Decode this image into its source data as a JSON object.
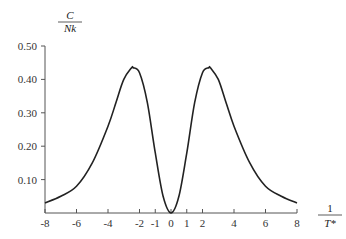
{
  "chart_data": {
    "type": "line",
    "title": "",
    "ylabel": {
      "numerator": "C",
      "denominator": "Nk"
    },
    "xlabel": {
      "numerator": "1",
      "denominator": "T*"
    },
    "xlim": [
      -8,
      8
    ],
    "ylim": [
      0,
      0.5
    ],
    "x_ticks": [
      -8,
      -6,
      -4,
      -2,
      -1,
      0,
      1,
      2,
      4,
      6,
      8
    ],
    "x_tick_labels": [
      "-8",
      "-6",
      "-4",
      "-2",
      "-1",
      "0",
      "1",
      "2",
      "4",
      "6",
      "8"
    ],
    "y_ticks": [
      0.1,
      0.2,
      0.3,
      0.4,
      0.5
    ],
    "y_tick_labels": [
      "0.10",
      "0.20",
      "0.30",
      "0.40",
      "0.50"
    ],
    "grid": false,
    "legend": null,
    "series": [
      {
        "name": "C/Nk",
        "x": [
          -8,
          -7,
          -6,
          -5,
          -4,
          -3.5,
          -3,
          -2.5,
          -2.4,
          -2,
          -1.5,
          -1,
          -0.5,
          0,
          0.5,
          1,
          1.5,
          2,
          2.4,
          2.5,
          3,
          3.5,
          4,
          5,
          6,
          7,
          8
        ],
        "y": [
          0.03,
          0.05,
          0.08,
          0.15,
          0.26,
          0.33,
          0.4,
          0.435,
          0.435,
          0.42,
          0.33,
          0.18,
          0.05,
          0.0,
          0.05,
          0.18,
          0.33,
          0.42,
          0.435,
          0.435,
          0.4,
          0.33,
          0.26,
          0.15,
          0.08,
          0.05,
          0.03
        ]
      }
    ],
    "color": "#222222"
  }
}
